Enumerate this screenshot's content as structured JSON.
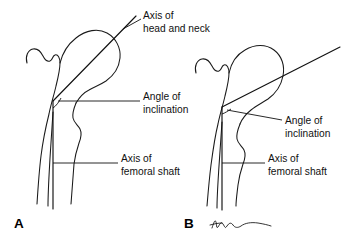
{
  "figure": {
    "title_hidden": "",
    "background_color": "#ffffff",
    "ink_color": "#111111",
    "panels": [
      {
        "id": "A",
        "letter": "A",
        "description": "proximal femur with normal angle of inclination",
        "labels": {
          "axis_head_neck_line1": "Axis of",
          "axis_head_neck_line2": "head and neck",
          "angle_line1": "Angle of",
          "angle_line2": "inclination",
          "shaft_line1": "Axis of",
          "shaft_line2": "femoral shaft"
        }
      },
      {
        "id": "B",
        "letter": "B",
        "description": "proximal femur with increased angle of inclination (coxa valga)",
        "labels": {
          "angle_line1": "Angle of",
          "angle_line2": "inclination",
          "shaft_line1": "Axis of",
          "shaft_line2": "femoral shaft"
        }
      }
    ],
    "signature": {
      "present": true,
      "name": "artist-signature"
    }
  }
}
